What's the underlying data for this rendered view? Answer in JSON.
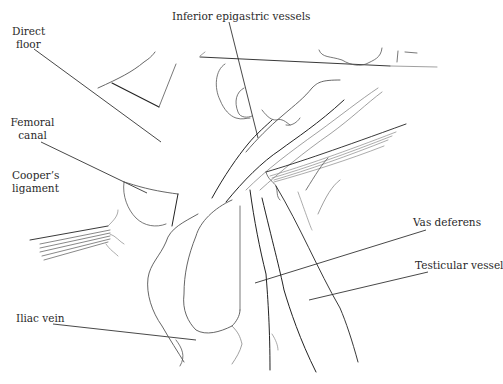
{
  "figure": {
    "type": "anatomical line drawing",
    "labels": [
      {
        "id": "direct-floor",
        "lines": [
          "Direct",
          "floor"
        ]
      },
      {
        "id": "inferior-epigastric",
        "lines": [
          "Inferior epigastric vessels"
        ]
      },
      {
        "id": "femoral-canal",
        "lines": [
          "Femoral",
          "canal"
        ]
      },
      {
        "id": "coopers-ligament",
        "lines": [
          "Cooper’s",
          "ligament"
        ]
      },
      {
        "id": "vas-deferens",
        "lines": [
          "Vas deferens"
        ]
      },
      {
        "id": "testicular-vessel",
        "lines": [
          "Testicular vessel"
        ]
      },
      {
        "id": "iliac-vein",
        "lines": [
          "Iliac vein"
        ]
      }
    ]
  }
}
